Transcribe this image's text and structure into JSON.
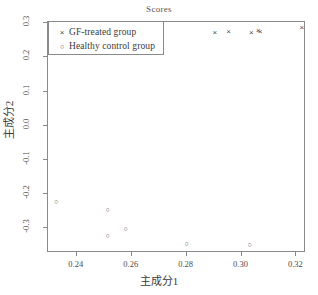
{
  "chart_data": {
    "type": "scatter",
    "title": "Scores",
    "xlabel": "主成分1",
    "ylabel": "主成分2",
    "xlim": [
      0.2295,
      0.3235
    ],
    "ylim": [
      -0.372,
      0.303
    ],
    "xticks": [
      "0.24",
      "0.26",
      "0.28",
      "0.30",
      "0.32"
    ],
    "xtick_values": [
      0.24,
      0.26,
      0.28,
      0.3,
      0.32
    ],
    "yticks": [
      "0.3",
      "0.2",
      "0.1",
      "0.0",
      "-0.1",
      "-0.2",
      "-0.3"
    ],
    "ytick_values": [
      0.3,
      0.2,
      0.1,
      0.0,
      -0.1,
      -0.2,
      -0.3
    ],
    "grid": false,
    "legend_position": "top-left",
    "series": [
      {
        "name": "GF-treated group",
        "marker": "x",
        "symbol": "×",
        "color": "#4a4a4a",
        "points": [
          {
            "x": 0.2903,
            "y": 0.271
          },
          {
            "x": 0.2953,
            "y": 0.274
          },
          {
            "x": 0.3036,
            "y": 0.271
          },
          {
            "x": 0.306,
            "y": 0.277
          },
          {
            "x": 0.3068,
            "y": 0.274
          },
          {
            "x": 0.322,
            "y": 0.285
          }
        ]
      },
      {
        "name": "Healthy control group",
        "marker": "o",
        "symbol": "○",
        "color": "#4a4a4a",
        "points": [
          {
            "x": 0.2325,
            "y": -0.224
          },
          {
            "x": 0.2512,
            "y": -0.245
          },
          {
            "x": 0.2512,
            "y": -0.321
          },
          {
            "x": 0.2578,
            "y": -0.302
          },
          {
            "x": 0.28,
            "y": -0.345
          },
          {
            "x": 0.303,
            "y": -0.348
          }
        ]
      }
    ]
  },
  "legend": {
    "entries": [
      {
        "symbol": "×",
        "label": "GF-treated group"
      },
      {
        "symbol": "○",
        "label": "Healthy control group"
      }
    ]
  }
}
